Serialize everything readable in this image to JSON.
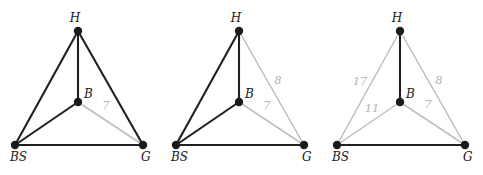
{
  "figure": {
    "title": "",
    "panel_count": 3,
    "colors": {
      "black_edge": "#231f20",
      "gray_edge": "#bdbdbd",
      "node": "#1a1a1a",
      "label_text": "#1a1a1a",
      "weight_text": "#b4b4b4",
      "background": "#ffffff"
    },
    "nodes": {
      "H": {
        "label": "H",
        "x": 78,
        "y": 31,
        "label_dx": -3,
        "label_dy": -9
      },
      "B": {
        "label": "B",
        "x": 78,
        "y": 102,
        "label_dx": 6,
        "label_dy": -4
      },
      "BS": {
        "label": "BS",
        "x": 15,
        "y": 145,
        "label_dx": -5,
        "label_dy": 16
      },
      "G": {
        "label": "G",
        "x": 143,
        "y": 145,
        "label_dx": -2,
        "label_dy": 16
      }
    },
    "panels": [
      {
        "name": "panel-1",
        "offset_x": 0,
        "black_edges": [
          {
            "from": "H",
            "to": "BS"
          },
          {
            "from": "H",
            "to": "B"
          },
          {
            "from": "H",
            "to": "G"
          },
          {
            "from": "B",
            "to": "BS"
          },
          {
            "from": "BS",
            "to": "G"
          }
        ],
        "gray_edges": [
          {
            "from": "B",
            "to": "G",
            "weight": "7",
            "label_x": 106,
            "label_y": 109
          }
        ]
      },
      {
        "name": "panel-2",
        "offset_x": 161,
        "black_edges": [
          {
            "from": "H",
            "to": "BS"
          },
          {
            "from": "H",
            "to": "B"
          },
          {
            "from": "B",
            "to": "BS"
          },
          {
            "from": "BS",
            "to": "G"
          }
        ],
        "gray_edges": [
          {
            "from": "H",
            "to": "G",
            "weight": "8",
            "label_x": 117,
            "label_y": 84
          },
          {
            "from": "B",
            "to": "G",
            "weight": "7",
            "label_x": 106,
            "label_y": 109
          }
        ]
      },
      {
        "name": "panel-3",
        "offset_x": 322,
        "black_edges": [
          {
            "from": "H",
            "to": "B"
          },
          {
            "from": "BS",
            "to": "G"
          }
        ],
        "gray_edges": [
          {
            "from": "H",
            "to": "BS",
            "weight": "17",
            "label_x": 38,
            "label_y": 85
          },
          {
            "from": "H",
            "to": "G",
            "weight": "8",
            "label_x": 117,
            "label_y": 84
          },
          {
            "from": "B",
            "to": "BS",
            "weight": "11",
            "label_x": 50,
            "label_y": 112
          },
          {
            "from": "B",
            "to": "G",
            "weight": "7",
            "label_x": 106,
            "label_y": 108
          }
        ]
      }
    ]
  }
}
